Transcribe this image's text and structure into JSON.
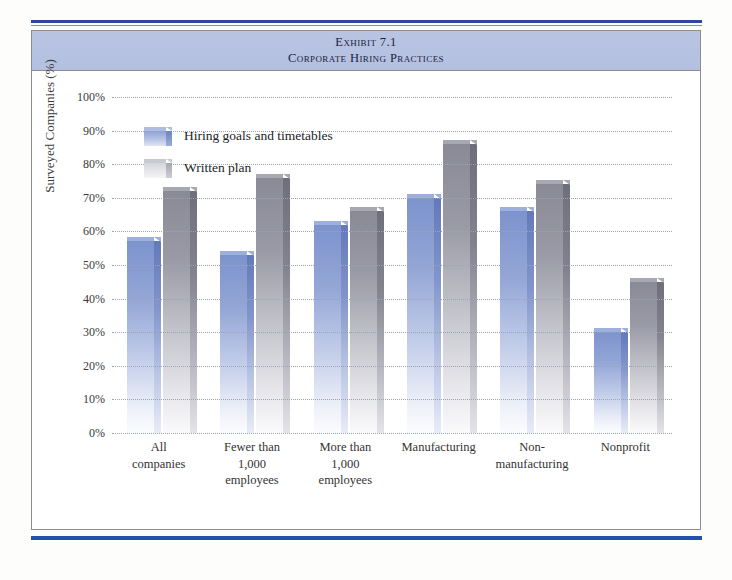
{
  "exhibit": {
    "number": "Exhibit 7.1",
    "title": "Corporate Hiring Practices"
  },
  "colors": {
    "series_blue": "#7d93cd",
    "series_gray": "#8a8a96",
    "header_background": "#b6c1e0",
    "rule_blue": "#2550ad",
    "gridline": "#9aa3b8"
  },
  "legend": {
    "position": "inside-top-left",
    "items": [
      {
        "label": "Hiring goals and timetables",
        "swatch": "blue"
      },
      {
        "label": "Written plan",
        "swatch": "gray"
      }
    ]
  },
  "chart_data": {
    "type": "bar",
    "title": "Corporate Hiring Practices",
    "subtitle": "Exhibit 7.1",
    "xlabel": "",
    "ylabel": "Surveyed Companies (%)",
    "ylim": [
      0,
      100
    ],
    "ytick_step": 10,
    "grid": true,
    "legend_position": "inside-top-left",
    "categories": [
      "All companies",
      "Fewer than 1,000 employees",
      "More than 1,000 employees",
      "Manufacturing",
      "Non-manufacturing",
      "Nonprofit"
    ],
    "category_lines": [
      [
        "All",
        "companies"
      ],
      [
        "Fewer  than",
        "1,000",
        "employees"
      ],
      [
        "More than",
        "1,000",
        "employees"
      ],
      [
        "Manufacturing"
      ],
      [
        "Non-",
        "manufacturing"
      ],
      [
        "Nonprofit"
      ]
    ],
    "ytick_labels": [
      "100%",
      "90%",
      "80%",
      "70%",
      "60%",
      "50%",
      "40%",
      "30%",
      "20%",
      "10%",
      "0%"
    ],
    "ytick_values": [
      100,
      90,
      80,
      70,
      60,
      50,
      40,
      30,
      20,
      10,
      0
    ],
    "series": [
      {
        "name": "Hiring goals and timetables",
        "color": "#7d93cd",
        "values": [
          57,
          53,
          62,
          70,
          66,
          30
        ]
      },
      {
        "name": "Written plan",
        "color": "#8a8a96",
        "values": [
          72,
          76,
          66,
          86,
          74,
          45
        ]
      }
    ]
  }
}
